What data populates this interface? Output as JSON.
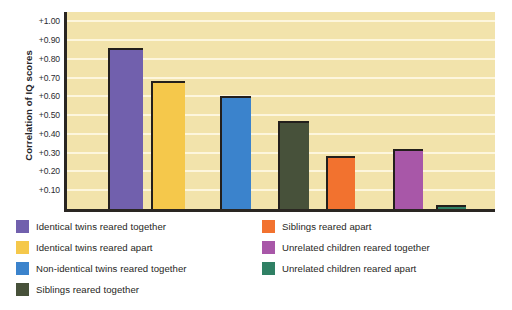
{
  "chart_data": {
    "type": "bar",
    "title": "",
    "xlabel": "",
    "ylabel": "Correlation of IQ scores",
    "ylim": [
      0,
      1.05
    ],
    "grid": true,
    "legend_position": "below-plot",
    "tick_labels": [
      "+1.00",
      "+0.90",
      "+0.80",
      "+0.70",
      "+0.60",
      "+0.50",
      "+0.40",
      "+0.30",
      "+0.20",
      "+0.10"
    ],
    "tick_values": [
      1.0,
      0.9,
      0.8,
      0.7,
      0.6,
      0.5,
      0.4,
      0.3,
      0.2,
      0.1
    ],
    "categories": [
      "Identical twins reared together",
      "Identical twins reared apart",
      "Non-identical twins reared together",
      "Siblings reared together",
      "Siblings reared apart",
      "Unrelated children reared together",
      "Unrelated children reared apart"
    ],
    "values": [
      0.86,
      0.68,
      0.6,
      0.47,
      0.28,
      0.32,
      0.02
    ],
    "colors": [
      "#7160ad",
      "#f5c84b",
      "#3b83cc",
      "#47513a",
      "#f2722f",
      "#a css",
      "#2f8064"
    ],
    "bar_colors": [
      "#7160ad",
      "#f5c84b",
      "#3b83cc",
      "#47513a",
      "#f2722f",
      "#a857a8",
      "#2f8064"
    ],
    "bar_left_pct": [
      9.5,
      19.6,
      35.7,
      49.3,
      60.5,
      76.2,
      86.2
    ],
    "bar_width_pct": [
      8.2,
      8.0,
      7.2,
      7.2,
      6.8,
      7.0,
      7.0
    ],
    "plot_background": "#f2e3ab",
    "gridline_color": "#fdf6dd",
    "axis_color": "#2a2622"
  },
  "legend": {
    "items": [
      {
        "label": "Identical twins reared together",
        "color": "#7160ad",
        "col": 0,
        "row": 0
      },
      {
        "label": "Identical twins reared apart",
        "color": "#f5c84b",
        "col": 0,
        "row": 1
      },
      {
        "label": "Non-identical twins reared together",
        "color": "#3b83cc",
        "col": 0,
        "row": 2
      },
      {
        "label": "Siblings reared together",
        "color": "#47513a",
        "col": 0,
        "row": 3
      },
      {
        "label": "Siblings reared apart",
        "color": "#f2722f",
        "col": 1,
        "row": 0
      },
      {
        "label": "Unrelated children reared together",
        "color": "#a857a8",
        "col": 1,
        "row": 1
      },
      {
        "label": "Unrelated children reared apart",
        "color": "#2f8064",
        "col": 1,
        "row": 2
      }
    ]
  }
}
